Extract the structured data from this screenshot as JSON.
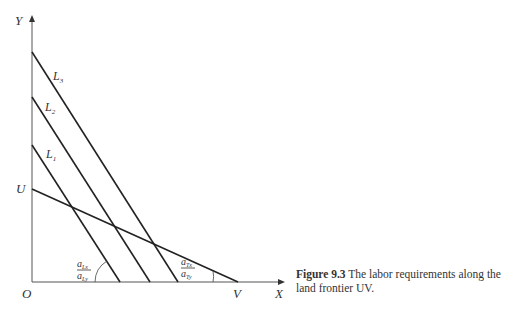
{
  "figure": {
    "caption_label": "Figure 9.3",
    "caption_text": " The labor requirements along the land frontier UV."
  },
  "axes": {
    "y_label": "Y",
    "x_label": "X",
    "origin_label": "O"
  },
  "points": {
    "u_label": "U",
    "v_label": "V"
  },
  "lines": [
    {
      "name": "L3",
      "label_main": "L",
      "label_sub": "3"
    },
    {
      "name": "L2",
      "label_main": "L",
      "label_sub": "2"
    },
    {
      "name": "L1",
      "label_main": "L",
      "label_sub": "1"
    }
  ],
  "angles": {
    "labor_ratio": {
      "num": "a",
      "num_sub": "Lx",
      "den": "a",
      "den_sub": "Ly"
    },
    "land_ratio": {
      "num": "a",
      "num_sub": "Tx",
      "den": "a",
      "den_sub": "Ty"
    }
  },
  "colors": {
    "stroke": "#222222",
    "text": "#333333"
  }
}
